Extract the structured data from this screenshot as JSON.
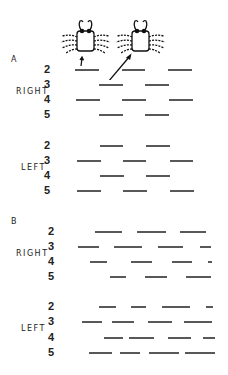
{
  "figure": {
    "sections": [
      {
        "id": "A",
        "label": "A",
        "groups": [
          {
            "side": "RIGHT",
            "rows": [
              {
                "leg": "2",
                "y": 70,
                "segments": [
                  [
                    75,
                    99
                  ],
                  [
                    122,
                    145
                  ],
                  [
                    168,
                    192
                  ]
                ]
              },
              {
                "leg": "3",
                "y": 85,
                "segments": [
                  [
                    99,
                    123
                  ],
                  [
                    145,
                    169
                  ]
                ]
              },
              {
                "leg": "4",
                "y": 100,
                "segments": [
                  [
                    76,
                    100
                  ],
                  [
                    122,
                    146
                  ],
                  [
                    169,
                    193
                  ]
                ]
              },
              {
                "leg": "5",
                "y": 115,
                "segments": [
                  [
                    99,
                    123
                  ],
                  [
                    145,
                    169
                  ]
                ]
              }
            ]
          },
          {
            "side": "LEFT",
            "rows": [
              {
                "leg": "2",
                "y": 146,
                "segments": [
                  [
                    100,
                    123
                  ],
                  [
                    146,
                    170
                  ]
                ]
              },
              {
                "leg": "3",
                "y": 161,
                "segments": [
                  [
                    77,
                    101
                  ],
                  [
                    123,
                    146
                  ],
                  [
                    170,
                    193
                  ]
                ]
              },
              {
                "leg": "4",
                "y": 176,
                "segments": [
                  [
                    100,
                    124
                  ],
                  [
                    146,
                    170
                  ]
                ]
              },
              {
                "leg": "5",
                "y": 191,
                "segments": [
                  [
                    77,
                    101
                  ],
                  [
                    123,
                    147
                  ],
                  [
                    170,
                    194
                  ]
                ]
              }
            ]
          }
        ]
      },
      {
        "id": "B",
        "label": "B",
        "groups": [
          {
            "side": "RIGHT",
            "rows": [
              {
                "leg": "2",
                "y": 232,
                "segments": [
                  [
                    95,
                    122
                  ],
                  [
                    137,
                    166
                  ],
                  [
                    180,
                    206
                  ]
                ]
              },
              {
                "leg": "3",
                "y": 247,
                "segments": [
                  [
                    78,
                    99
                  ],
                  [
                    114,
                    142
                  ],
                  [
                    158,
                    183
                  ],
                  [
                    200,
                    211
                  ]
                ]
              },
              {
                "leg": "4",
                "y": 262,
                "segments": [
                  [
                    90,
                    107
                  ],
                  [
                    131,
                    152
                  ],
                  [
                    172,
                    192
                  ],
                  [
                    208,
                    212
                  ]
                ]
              },
              {
                "leg": "5",
                "y": 277,
                "segments": [
                  [
                    110,
                    126
                  ],
                  [
                    145,
                    167
                  ],
                  [
                    186,
                    211
                  ]
                ]
              }
            ]
          },
          {
            "side": "LEFT",
            "rows": [
              {
                "leg": "2",
                "y": 307,
                "segments": [
                  [
                    99,
                    116
                  ],
                  [
                    131,
                    146
                  ],
                  [
                    162,
                    190
                  ],
                  [
                    206,
                    213
                  ]
                ]
              },
              {
                "leg": "3",
                "y": 322,
                "segments": [
                  [
                    82,
                    102
                  ],
                  [
                    112,
                    134
                  ],
                  [
                    148,
                    172
                  ],
                  [
                    184,
                    212
                  ]
                ]
              },
              {
                "leg": "4",
                "y": 338,
                "segments": [
                  [
                    104,
                    123
                  ],
                  [
                    129,
                    154
                  ],
                  [
                    168,
                    191
                  ],
                  [
                    203,
                    215
                  ]
                ]
              },
              {
                "leg": "5",
                "y": 353,
                "segments": [
                  [
                    89,
                    112
                  ],
                  [
                    120,
                    140
                  ],
                  [
                    149,
                    179
                  ],
                  [
                    185,
                    215
                  ]
                ]
              }
            ]
          }
        ]
      }
    ],
    "icons": [
      "crab-icon",
      "crab-icon"
    ],
    "colors": {
      "ink": "#111111",
      "background": "#ffffff"
    }
  }
}
